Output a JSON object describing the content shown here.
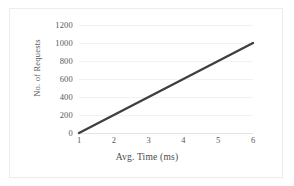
{
  "chart_data": {
    "type": "line",
    "title": "",
    "xlabel": "Avg. Time (ms)",
    "ylabel": "No. of Requests",
    "x": [
      1,
      6
    ],
    "values": [
      0,
      1000
    ],
    "series": [
      {
        "name": "No. of Requests",
        "x": [
          1,
          2,
          3,
          4,
          5,
          6
        ],
        "values": [
          0,
          200,
          400,
          600,
          800,
          1000
        ],
        "color": "#3f3f3f"
      }
    ],
    "xlim": [
      1,
      6
    ],
    "ylim": [
      0,
      1200
    ],
    "xticks": [
      "1",
      "2",
      "3",
      "4",
      "5",
      "6"
    ],
    "yticks": [
      "0",
      "200",
      "400",
      "600",
      "800",
      "1000",
      "1200"
    ],
    "grid": "horizontal",
    "legend": "none",
    "gridline_color": "#f2f2f3",
    "border_color": "#ececed",
    "tick_label_color": "#595959"
  }
}
